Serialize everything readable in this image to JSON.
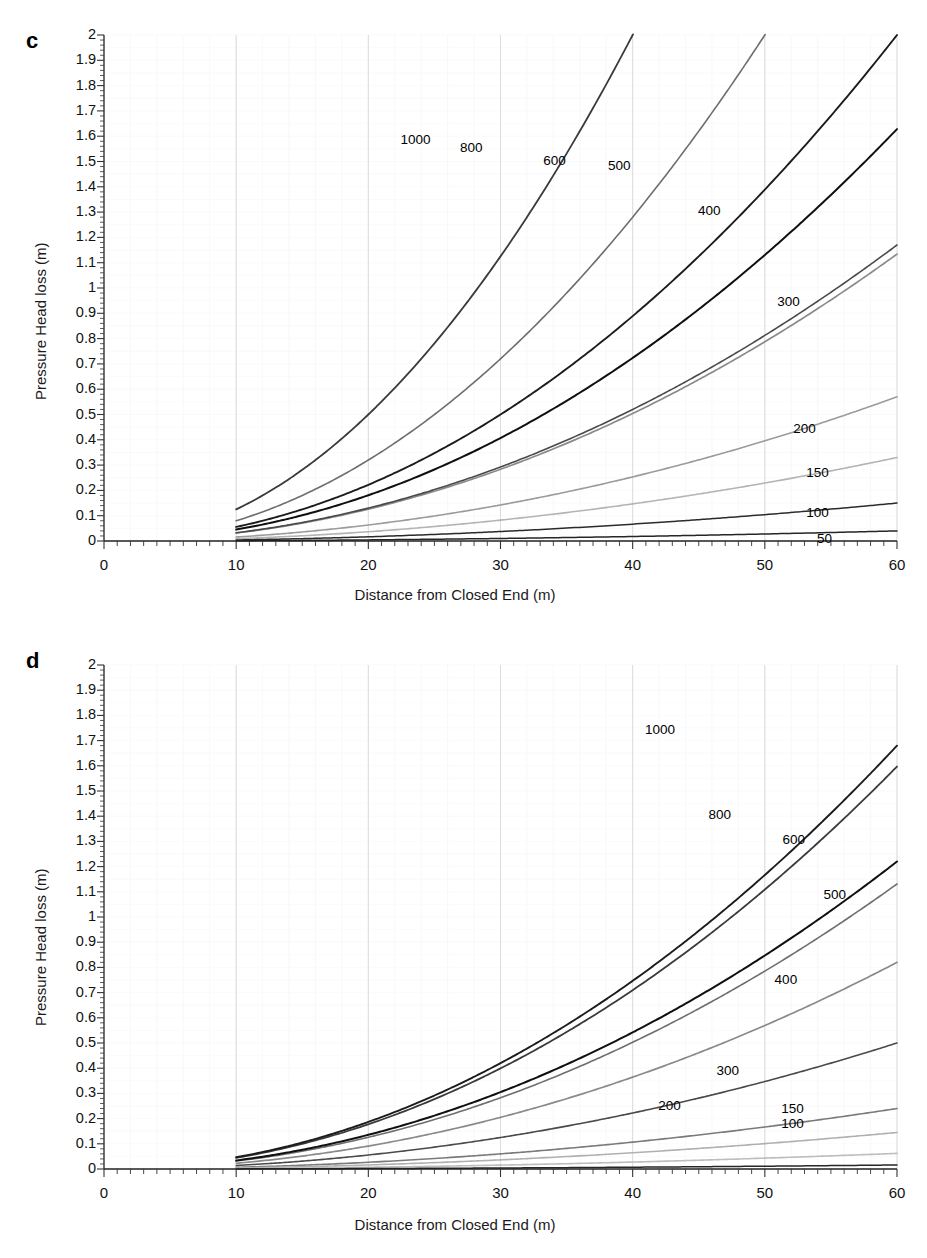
{
  "figure": {
    "panels": [
      {
        "letter": "c",
        "note": "Pipe diameter -58.6 mm",
        "xlabel": "Distance from Closed End (m)",
        "ylabel": "Pressure Head loss (m)"
      },
      {
        "letter": "d",
        "note": "Pipe Diameter - 69.8 mm",
        "xlabel": "Distance from Closed End (m)",
        "ylabel": "Pressure Head loss (m)"
      }
    ]
  },
  "axes": {
    "y_ticks": [
      "0",
      "0.1",
      "0.2",
      "0.3",
      "0.4",
      "0.5",
      "0.6",
      "0.7",
      "0.8",
      "0.9",
      "1",
      "1.1",
      "1.2",
      "1.3",
      "1.4",
      "1.5",
      "1.6",
      "1.7",
      "1.8",
      "1.9",
      "2"
    ],
    "x_ticks": [
      "0",
      "10",
      "20",
      "30",
      "40",
      "50",
      "60"
    ],
    "xlim": [
      0,
      60
    ],
    "ylim": [
      0,
      2
    ],
    "y_minor_step": 0.02,
    "x_minor_step": 2
  },
  "chart_data": [
    {
      "type": "line",
      "title": "c",
      "annotation": "Pipe diameter -58.6 mm",
      "xlabel": "Distance from Closed End (m)",
      "ylabel": "Pressure Head loss (m)",
      "xlim": [
        0,
        60
      ],
      "ylim": [
        0,
        2
      ],
      "xticks": [
        0,
        10,
        20,
        30,
        40,
        50,
        60
      ],
      "yticks": [
        0,
        0.1,
        0.2,
        0.3,
        0.4,
        0.5,
        0.6,
        0.7,
        0.8,
        0.9,
        1,
        1.1,
        1.2,
        1.3,
        1.4,
        1.5,
        1.6,
        1.7,
        1.8,
        1.9,
        2
      ],
      "grid": true,
      "legend": "inline-curve-labels",
      "x": [
        10,
        15,
        20,
        25,
        30,
        35,
        40,
        45,
        50,
        55,
        60
      ],
      "series": [
        {
          "name": "1000",
          "label": "1000",
          "color": "#3a3a3a",
          "width": 1.8,
          "values": [
            0.073,
            0.219,
            0.438,
            0.73,
            1.095,
            1.533,
            2.0,
            null,
            null,
            null,
            null
          ],
          "exit_top_x": 27.8
        },
        {
          "name": "800",
          "label": "800",
          "color": "#6e6e6e",
          "width": 1.6,
          "values": [
            0.052,
            0.155,
            0.31,
            0.517,
            0.775,
            1.085,
            1.447,
            1.86,
            2.0,
            null,
            null
          ],
          "exit_top_x": 31.1
        },
        {
          "name": "600",
          "label": "600",
          "color": "#1c1c1c",
          "width": 1.9,
          "values": [
            0.034,
            0.101,
            0.201,
            0.335,
            0.503,
            0.704,
            0.939,
            1.207,
            1.509,
            1.845,
            2.0
          ],
          "exit_top_x": 35.4
        },
        {
          "name": "500",
          "label": "500",
          "color": "#101010",
          "width": 2.0,
          "values": [
            0.025,
            0.074,
            0.148,
            0.247,
            0.37,
            0.518,
            0.691,
            0.888,
            1.11,
            1.357,
            1.628
          ],
          "exit_top_x": 40.6
        },
        {
          "name": "400",
          "label": "400",
          "color": "#8a8a8a",
          "width": 1.7,
          "values": [
            0.017,
            0.052,
            0.103,
            0.172,
            0.258,
            0.361,
            0.481,
            0.619,
            0.773,
            0.945,
            1.134
          ],
          "exit_top_x": 45.7
        },
        {
          "name": "300",
          "label": "300",
          "color": "#4a4a4a",
          "width": 1.6,
          "values": [
            0.011,
            0.032,
            0.063,
            0.105,
            0.158,
            0.221,
            0.295,
            0.379,
            0.474,
            0.579,
            0.695
          ],
          "right_value": 1.17
        },
        {
          "name": "200",
          "label": "200",
          "color": "#9b9b9b",
          "width": 1.6,
          "values": [
            0.005,
            0.015,
            0.031,
            0.051,
            0.077,
            0.107,
            0.143,
            0.184,
            0.23,
            0.281,
            0.337
          ],
          "right_value": 0.57
        },
        {
          "name": "150",
          "label": "150",
          "color": "#b4b4b4",
          "width": 1.6,
          "values": [
            0.003,
            0.009,
            0.018,
            0.03,
            0.045,
            0.063,
            0.084,
            0.108,
            0.135,
            0.165,
            0.198
          ],
          "right_value": 0.33
        },
        {
          "name": "100",
          "label": "100",
          "color": "#2b2b2b",
          "width": 1.5,
          "values": [
            0.0014,
            0.004,
            0.009,
            0.014,
            0.021,
            0.029,
            0.039,
            0.05,
            0.063,
            0.077,
            0.092
          ],
          "right_value": 0.15
        },
        {
          "name": "50",
          "label": "50",
          "color": "#262626",
          "width": 1.5,
          "values": [
            0.0004,
            0.001,
            0.002,
            0.004,
            0.006,
            0.008,
            0.011,
            0.014,
            0.017,
            0.021,
            0.025
          ],
          "right_value": 0.04
        }
      ]
    },
    {
      "type": "line",
      "title": "d",
      "annotation": "Pipe Diameter - 69.8 mm",
      "xlabel": "Distance from Closed End (m)",
      "ylabel": "Pressure Head loss (m)",
      "xlim": [
        0,
        60
      ],
      "ylim": [
        0,
        2
      ],
      "xticks": [
        0,
        10,
        20,
        30,
        40,
        50,
        60
      ],
      "yticks": [
        0,
        0.1,
        0.2,
        0.3,
        0.4,
        0.5,
        0.6,
        0.7,
        0.8,
        0.9,
        1,
        1.1,
        1.2,
        1.3,
        1.4,
        1.5,
        1.6,
        1.7,
        1.8,
        1.9,
        2
      ],
      "grid": true,
      "legend": "inline-curve-labels",
      "x": [
        10,
        15,
        20,
        25,
        30,
        35,
        40,
        45,
        50,
        55,
        60
      ],
      "series": [
        {
          "name": "1000",
          "label": "1000",
          "color": "#3a3a3a",
          "width": 1.8,
          "values": [
            0.024,
            0.073,
            0.145,
            0.242,
            0.363,
            0.508,
            0.678,
            0.871,
            1.089,
            1.331,
            1.597
          ],
          "exit_top_x": 46.2
        },
        {
          "name": "800",
          "label": "800",
          "color": "#6e6e6e",
          "width": 1.6,
          "values": [
            0.017,
            0.051,
            0.103,
            0.171,
            0.257,
            0.36,
            0.48,
            0.617,
            0.771,
            0.943,
            1.131
          ],
          "exit_top_x": 52.0
        },
        {
          "name": "600",
          "label": "600",
          "color": "#1c1c1c",
          "width": 1.9,
          "values": [
            0.011,
            0.033,
            0.066,
            0.11,
            0.165,
            0.231,
            0.308,
            0.396,
            0.495,
            0.605,
            0.726
          ],
          "right_value": 1.68
        },
        {
          "name": "500",
          "label": "500",
          "color": "#101010",
          "width": 2.0,
          "values": [
            0.008,
            0.024,
            0.048,
            0.081,
            0.121,
            0.169,
            0.226,
            0.29,
            0.363,
            0.444,
            0.533
          ],
          "right_value": 1.22
        },
        {
          "name": "400",
          "label": "400",
          "color": "#8a8a8a",
          "width": 1.7,
          "values": [
            0.006,
            0.017,
            0.034,
            0.056,
            0.085,
            0.118,
            0.158,
            0.203,
            0.254,
            0.31,
            0.372
          ],
          "right_value": 0.82
        },
        {
          "name": "300",
          "label": "300",
          "color": "#4a4a4a",
          "width": 1.6,
          "values": [
            0.003,
            0.01,
            0.021,
            0.034,
            0.052,
            0.072,
            0.096,
            0.124,
            0.155,
            0.189,
            0.227
          ],
          "right_value": 0.5
        },
        {
          "name": "200",
          "label": "200",
          "color": "#7a7a7a",
          "width": 1.6,
          "values": [
            0.0016,
            0.005,
            0.01,
            0.017,
            0.025,
            0.035,
            0.047,
            0.06,
            0.075,
            0.092,
            0.11
          ],
          "right_value": 0.24
        },
        {
          "name": "150",
          "label": "150",
          "color": "#b0b0b0",
          "width": 1.6,
          "values": [
            0.0009,
            0.003,
            0.006,
            0.01,
            0.015,
            0.021,
            0.028,
            0.036,
            0.044,
            0.054,
            0.065
          ],
          "right_value": 0.145
        },
        {
          "name": "100",
          "label": "100",
          "color": "#bdbdbd",
          "width": 1.6,
          "values": [
            0.0004,
            0.0013,
            0.0026,
            0.0044,
            0.0065,
            0.009,
            0.012,
            0.0155,
            0.0193,
            0.0236,
            0.0283
          ],
          "right_value": 0.062
        },
        {
          "name": "50",
          "label": "50",
          "color": "#262626",
          "width": 1.5,
          "values": [
            0.0001,
            0.0003,
            0.0007,
            0.0011,
            0.0017,
            0.0024,
            0.0032,
            0.0041,
            0.0051,
            0.0062,
            0.0075
          ],
          "right_value": 0.016
        }
      ]
    }
  ],
  "curve_labels": {
    "c": [
      {
        "text": "1000",
        "x": 23.5,
        "y": 1.58
      },
      {
        "text": "800",
        "x": 28.0,
        "y": 1.55
      },
      {
        "text": "600",
        "x": 34.3,
        "y": 1.5
      },
      {
        "text": "500",
        "x": 39.2,
        "y": 1.48
      },
      {
        "text": "400",
        "x": 46.0,
        "y": 1.3
      },
      {
        "text": "300",
        "x": 52.0,
        "y": 0.94
      },
      {
        "text": "200",
        "x": 53.2,
        "y": 0.44
      },
      {
        "text": "150",
        "x": 54.2,
        "y": 0.265
      },
      {
        "text": "100",
        "x": 54.2,
        "y": 0.105
      },
      {
        "text": "50",
        "x": 55.0,
        "y": 0.005
      }
    ],
    "d": [
      {
        "text": "1000",
        "x": 42.0,
        "y": 1.74
      },
      {
        "text": "800",
        "x": 46.8,
        "y": 1.4
      },
      {
        "text": "600",
        "x": 52.4,
        "y": 1.3
      },
      {
        "text": "500",
        "x": 55.5,
        "y": 1.085
      },
      {
        "text": "400",
        "x": 51.8,
        "y": 0.745
      },
      {
        "text": "300",
        "x": 47.4,
        "y": 0.385
      },
      {
        "text": "200",
        "x": 43.0,
        "y": 0.245
      },
      {
        "text": "150",
        "x": 52.3,
        "y": 0.235
      },
      {
        "text": "100",
        "x": 52.3,
        "y": 0.175
      }
    ]
  }
}
